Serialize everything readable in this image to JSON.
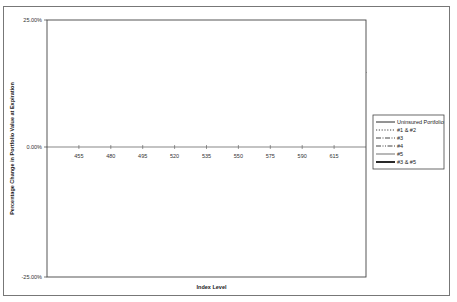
{
  "chart_data": {
    "type": "line",
    "title": "",
    "xlabel": "Index Level",
    "ylabel": "Percentage Change in Portfolio Value at Expiration",
    "ylim": [
      -25,
      25
    ],
    "y_ticks": [
      "25.00%",
      "0.00%",
      "-25.00%"
    ],
    "y_tick_values": [
      25,
      0,
      -25
    ],
    "x_ticks": [
      "455",
      "480",
      "495",
      "520",
      "535",
      "550",
      "575",
      "590",
      "615"
    ],
    "x_tick_positions": [
      1,
      2,
      3,
      4,
      5,
      6,
      7,
      8,
      9
    ],
    "xlim": [
      0,
      10
    ],
    "grid": false,
    "legend_position": "right",
    "series": [
      {
        "name": "Uninsured Portfolio",
        "style": "solid",
        "width": 0.9,
        "points": [
          [
            0,
            -22.3
          ],
          [
            10,
            22.6
          ]
        ]
      },
      {
        "name": "#1 & #2",
        "style": "dotted",
        "width": 0.8,
        "points": [
          [
            0,
            4.8
          ],
          [
            10,
            4.8
          ]
        ]
      },
      {
        "name": "#3",
        "style": "dashdot",
        "width": 0.8,
        "points": [
          [
            0,
            -3.7
          ],
          [
            5.2,
            -3.7
          ],
          [
            10,
            18.1
          ]
        ]
      },
      {
        "name": "#4",
        "style": "dashdotdot",
        "width": 0.8,
        "points": [
          [
            0,
            -4.6
          ],
          [
            5.5,
            -4.6
          ],
          [
            6.0,
            -3.7
          ]
        ]
      },
      {
        "name": "#5",
        "style": "solid",
        "width": 0.6,
        "points": [
          [
            0,
            5.3
          ],
          [
            4.0,
            -12.1
          ],
          [
            6.0,
            -3.5
          ]
        ]
      },
      {
        "name": "#3 & #5",
        "style": "solid",
        "width": 1.8,
        "points": [
          [
            6.0,
            -3.5
          ],
          [
            10,
            14.8
          ]
        ]
      }
    ]
  }
}
